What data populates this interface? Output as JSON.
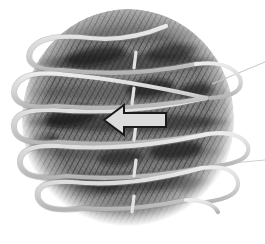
{
  "figure": {
    "title": "Banded sphere with wrapped helical coil",
    "description": "Grayscale sketch of a banded spherical body encircled by a helical coil, with a block arrow indicating direction",
    "background_color": "#ffffff",
    "width": 265,
    "height": 244
  },
  "sphere": {
    "name": "banded-sphere",
    "center_x": 128,
    "center_y": 120,
    "radius_x": 105,
    "radius_y": 110,
    "fill_base_color": "#6e6e6e",
    "shading": "sketch-hatch",
    "edge_softness": "feathered",
    "bands": [
      {
        "label": "band-1",
        "y": 34,
        "darkness": 0.55
      },
      {
        "label": "band-2",
        "y": 62,
        "darkness": 0.72
      },
      {
        "label": "band-3",
        "y": 92,
        "darkness": 0.48
      },
      {
        "label": "band-4",
        "y": 122,
        "darkness": 0.78
      },
      {
        "label": "band-5",
        "y": 152,
        "darkness": 0.58
      },
      {
        "label": "band-6",
        "y": 182,
        "darkness": 0.7
      },
      {
        "label": "band-7",
        "y": 208,
        "darkness": 0.5
      }
    ],
    "storm_spots": [
      {
        "label": "spot-a",
        "cx": 96,
        "cy": 56,
        "rx": 30,
        "ry": 9,
        "angle": -10
      },
      {
        "label": "spot-b",
        "cx": 172,
        "cy": 52,
        "rx": 26,
        "ry": 8,
        "angle": -8
      },
      {
        "label": "spot-c",
        "cx": 150,
        "cy": 88,
        "rx": 24,
        "ry": 9,
        "angle": -6
      },
      {
        "label": "spot-d",
        "cx": 196,
        "cy": 90,
        "rx": 18,
        "ry": 7,
        "angle": -6
      },
      {
        "label": "spot-e",
        "cx": 72,
        "cy": 116,
        "rx": 26,
        "ry": 10,
        "angle": -12
      },
      {
        "label": "spot-f",
        "cx": 42,
        "cy": 142,
        "rx": 16,
        "ry": 7,
        "angle": -14
      },
      {
        "label": "spot-g",
        "cx": 176,
        "cy": 150,
        "rx": 26,
        "ry": 9,
        "angle": -6
      },
      {
        "label": "spot-h",
        "cx": 120,
        "cy": 158,
        "rx": 22,
        "ry": 8,
        "angle": -4
      },
      {
        "label": "spot-i",
        "cx": 96,
        "cy": 188,
        "rx": 24,
        "ry": 8,
        "angle": -4
      }
    ]
  },
  "coil": {
    "name": "helical-coil",
    "stroke_color": "#d8d8d8",
    "stroke_color_shadow": "#9a9a9a",
    "stroke_width": 4.2,
    "turns": 6,
    "description": "Light gray helix wound around the sphere with loops protruding past the left and right limbs",
    "turn_y_positions": [
      36,
      72,
      108,
      144,
      180,
      214
    ],
    "loop_left_x": 16,
    "loop_right_x": 240,
    "crossing_markers": [
      {
        "label": "crossing-1",
        "x": 136,
        "y": 60
      },
      {
        "label": "crossing-2",
        "x": 134,
        "y": 96
      },
      {
        "label": "crossing-3",
        "x": 136,
        "y": 132
      },
      {
        "label": "crossing-4",
        "x": 136,
        "y": 168
      },
      {
        "label": "crossing-5",
        "x": 134,
        "y": 204
      }
    ]
  },
  "arrow": {
    "name": "direction-arrow",
    "direction": "left",
    "fill_color": "#dcdcdc",
    "stroke_color": "#1a1a1a",
    "stroke_width": 2,
    "tip_x": 104,
    "tail_x": 166,
    "center_y": 120,
    "shaft_half_height": 7,
    "head_half_height": 15,
    "head_length": 20
  },
  "leader_lines": [
    {
      "name": "leader-line-upper",
      "x1": 212,
      "y1": 84,
      "x2": 265,
      "y2": 62,
      "color": "#c9c9c9"
    },
    {
      "name": "leader-line-lower",
      "x1": 232,
      "y1": 163,
      "x2": 265,
      "y2": 160,
      "color": "#cfcfcf"
    }
  ],
  "palette": {
    "ink_dark": "#1a1a1a",
    "sphere_mid": "#707070",
    "sphere_dark": "#2b2b2b",
    "coil_light": "#d8d8d8",
    "paper": "#ffffff"
  }
}
